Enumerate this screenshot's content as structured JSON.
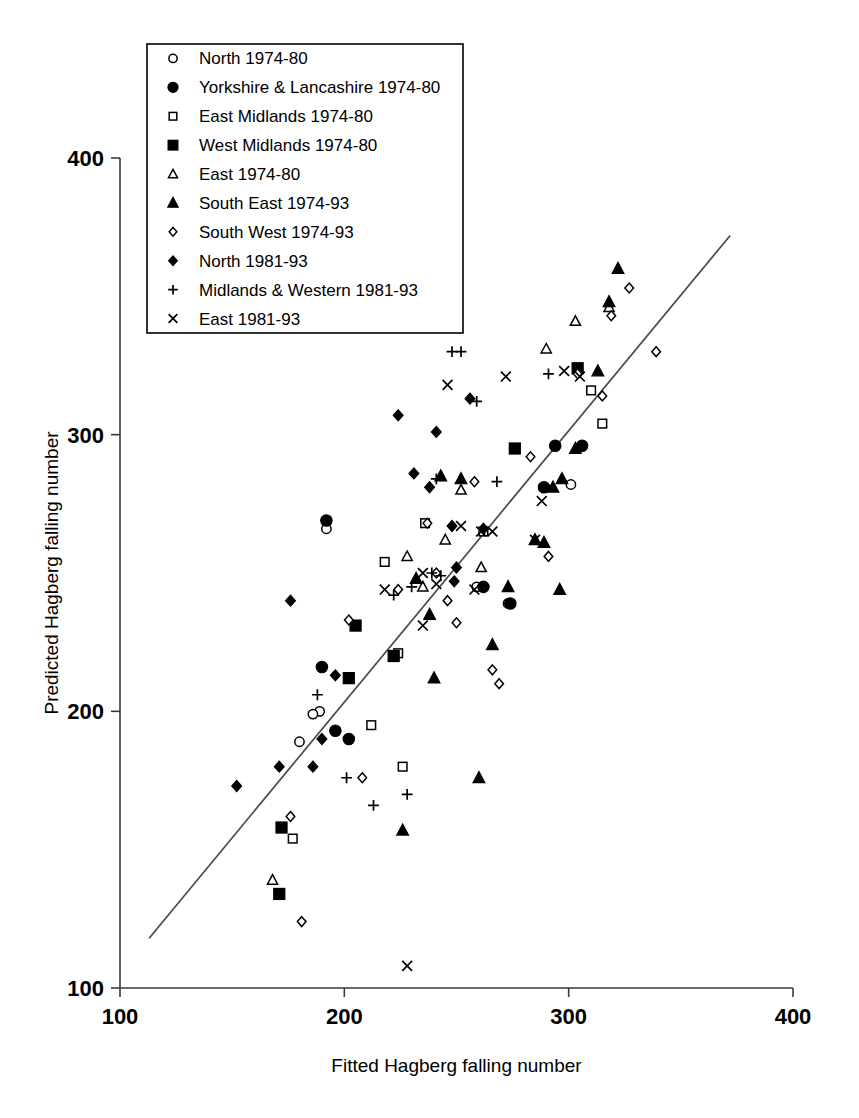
{
  "chart_data": {
    "type": "scatter",
    "title": "",
    "xlabel": "Fitted Hagberg falling number",
    "ylabel": "Predicted Hagberg falling number",
    "xlim": [
      100,
      400
    ],
    "ylim": [
      100,
      400
    ],
    "xticks": [
      100,
      200,
      300,
      400
    ],
    "yticks": [
      100,
      200,
      300,
      400
    ],
    "xtick_labels": [
      "100",
      "200",
      "300",
      "400"
    ],
    "ytick_labels": [
      "100",
      "200",
      "300",
      "400"
    ],
    "grid": false,
    "legend_position": "upper-left",
    "reference_line": {
      "label": "1:1 line",
      "x": [
        113,
        372
      ],
      "y": [
        118,
        372
      ]
    },
    "series": [
      {
        "name": "North 1974-80",
        "marker": "open-circle",
        "points": [
          [
            192,
            266
          ],
          [
            189,
            200
          ],
          [
            186,
            199
          ],
          [
            180,
            189
          ],
          [
            259,
            245
          ],
          [
            301,
            282
          ],
          [
            273,
            239
          ]
        ]
      },
      {
        "name": "Yorkshire & Lancashire 1974-80",
        "marker": "filled-circle",
        "points": [
          [
            192,
            269
          ],
          [
            190,
            216
          ],
          [
            196,
            193
          ],
          [
            202,
            190
          ],
          [
            274,
            239
          ],
          [
            289,
            281
          ],
          [
            294,
            296
          ],
          [
            306,
            296
          ],
          [
            262,
            245
          ]
        ]
      },
      {
        "name": "East Midlands 1974-80",
        "marker": "open-square",
        "points": [
          [
            218,
            254
          ],
          [
            224,
            221
          ],
          [
            212,
            195
          ],
          [
            177,
            154
          ],
          [
            236,
            268
          ],
          [
            262,
            265
          ],
          [
            310,
            316
          ],
          [
            315,
            304
          ],
          [
            226,
            180
          ]
        ]
      },
      {
        "name": "West Midlands 1974-80",
        "marker": "filled-square",
        "points": [
          [
            205,
            231
          ],
          [
            202,
            212
          ],
          [
            222,
            220
          ],
          [
            172,
            158
          ],
          [
            171,
            134
          ],
          [
            276,
            295
          ],
          [
            304,
            324
          ]
        ]
      },
      {
        "name": "East 1974-80",
        "marker": "open-triangle",
        "points": [
          [
            228,
            256
          ],
          [
            235,
            245
          ],
          [
            245,
            262
          ],
          [
            168,
            139
          ],
          [
            252,
            280
          ],
          [
            290,
            331
          ],
          [
            303,
            341
          ],
          [
            318,
            346
          ],
          [
            261,
            252
          ]
        ]
      },
      {
        "name": "South East 1974-93",
        "marker": "filled-triangle",
        "points": [
          [
            243,
            285
          ],
          [
            252,
            284
          ],
          [
            232,
            248
          ],
          [
            240,
            212
          ],
          [
            260,
            176
          ],
          [
            266,
            224
          ],
          [
            273,
            245
          ],
          [
            285,
            262
          ],
          [
            289,
            261
          ],
          [
            226,
            157
          ],
          [
            297,
            284
          ],
          [
            313,
            323
          ],
          [
            322,
            360
          ],
          [
            318,
            348
          ],
          [
            293,
            281
          ],
          [
            303,
            295
          ],
          [
            238,
            235
          ],
          [
            296,
            244
          ]
        ]
      },
      {
        "name": "South West 1974-93",
        "marker": "open-diamond",
        "points": [
          [
            202,
            233
          ],
          [
            176,
            162
          ],
          [
            181,
            124
          ],
          [
            208,
            176
          ],
          [
            246,
            240
          ],
          [
            250,
            232
          ],
          [
            241,
            250
          ],
          [
            258,
            283
          ],
          [
            266,
            215
          ],
          [
            269,
            210
          ],
          [
            283,
            292
          ],
          [
            291,
            256
          ],
          [
            304,
            322
          ],
          [
            315,
            314
          ],
          [
            319,
            343
          ],
          [
            327,
            353
          ],
          [
            339,
            330
          ],
          [
            237,
            268
          ],
          [
            224,
            244
          ]
        ]
      },
      {
        "name": "North 1981-93",
        "marker": "filled-diamond",
        "points": [
          [
            152,
            173
          ],
          [
            171,
            180
          ],
          [
            176,
            240
          ],
          [
            186,
            180
          ],
          [
            190,
            190
          ],
          [
            224,
            307
          ],
          [
            231,
            286
          ],
          [
            238,
            281
          ],
          [
            241,
            301
          ],
          [
            249,
            247
          ],
          [
            250,
            252
          ],
          [
            256,
            313
          ],
          [
            248,
            267
          ],
          [
            196,
            213
          ],
          [
            262,
            266
          ]
        ]
      },
      {
        "name": "Midlands & Western 1981-93",
        "marker": "plus",
        "points": [
          [
            188,
            206
          ],
          [
            201,
            176
          ],
          [
            213,
            166
          ],
          [
            222,
            242
          ],
          [
            230,
            245
          ],
          [
            239,
            250
          ],
          [
            243,
            249
          ],
          [
            241,
            284
          ],
          [
            248,
            330
          ],
          [
            252,
            330
          ],
          [
            259,
            312
          ],
          [
            268,
            283
          ],
          [
            291,
            322
          ],
          [
            228,
            170
          ]
        ]
      },
      {
        "name": "East 1981-93",
        "marker": "cross",
        "points": [
          [
            218,
            244
          ],
          [
            228,
            108
          ],
          [
            235,
            231
          ],
          [
            241,
            246
          ],
          [
            246,
            318
          ],
          [
            252,
            267
          ],
          [
            258,
            244
          ],
          [
            261,
            265
          ],
          [
            266,
            265
          ],
          [
            272,
            321
          ],
          [
            285,
            262
          ],
          [
            288,
            276
          ],
          [
            298,
            323
          ],
          [
            305,
            321
          ],
          [
            235,
            250
          ]
        ]
      }
    ]
  },
  "legend": {
    "items": [
      {
        "marker": "open-circle",
        "label": "North 1974-80"
      },
      {
        "marker": "filled-circle",
        "label": "Yorkshire & Lancashire 1974-80"
      },
      {
        "marker": "open-square",
        "label": "East Midlands 1974-80"
      },
      {
        "marker": "filled-square",
        "label": "West Midlands 1974-80"
      },
      {
        "marker": "open-triangle",
        "label": "East 1974-80"
      },
      {
        "marker": "filled-triangle",
        "label": "South East 1974-93"
      },
      {
        "marker": "open-diamond",
        "label": "South West 1974-93"
      },
      {
        "marker": "filled-diamond",
        "label": "North 1981-93"
      },
      {
        "marker": "plus",
        "label": "Midlands & Western 1981-93"
      },
      {
        "marker": "cross",
        "label": "East 1981-93"
      }
    ]
  },
  "axes": {
    "x_title": "Fitted Hagberg falling number",
    "y_title": "Predicted Hagberg falling number",
    "x_tick_labels": [
      "100",
      "200",
      "300",
      "400"
    ],
    "y_tick_labels": [
      "100",
      "200",
      "300",
      "400"
    ]
  }
}
